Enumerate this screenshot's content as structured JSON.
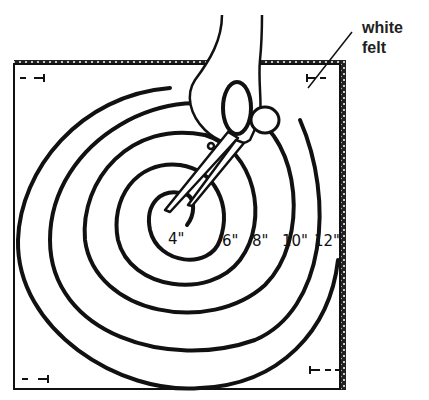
{
  "illustration": {
    "description": "Hand-drawn diagram of a hand cutting a spiral out of a square of white felt with scissors",
    "callout": {
      "line1": "white",
      "line2": "felt"
    },
    "measurements": [
      "4\"",
      "6\"",
      "8\"",
      "10\"",
      "12\""
    ],
    "corner_marks": [
      "- ⊣",
      "⊢ -",
      "- ⊣",
      "⊢ - -"
    ]
  }
}
